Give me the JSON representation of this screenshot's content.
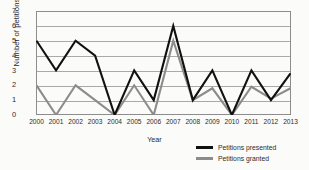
{
  "chart_data": {
    "type": "line",
    "title": "",
    "xlabel": "Year",
    "ylabel": "Number of petitions",
    "categories": [
      "2000",
      "2001",
      "2002",
      "2003",
      "2004",
      "2005",
      "2006",
      "2007",
      "2008",
      "2009",
      "2010",
      "2011",
      "2012",
      "2013"
    ],
    "yticks": [
      "7",
      "6",
      "5",
      "4",
      "3",
      "2",
      "1",
      "0"
    ],
    "ylim": [
      0,
      7
    ],
    "grid": true,
    "legend_position": "bottom-right",
    "series": [
      {
        "name": "Petitions presented",
        "color": "#111111",
        "values": [
          5,
          3,
          5,
          4,
          0,
          3,
          1,
          6,
          1,
          3,
          0,
          3,
          1,
          2.8
        ]
      },
      {
        "name": "Petitions granted",
        "color": "#8c8c8c",
        "values": [
          2,
          0,
          2,
          1,
          0,
          2,
          0,
          5,
          1,
          1.8,
          0,
          1.9,
          1.1,
          1.8
        ]
      }
    ]
  }
}
